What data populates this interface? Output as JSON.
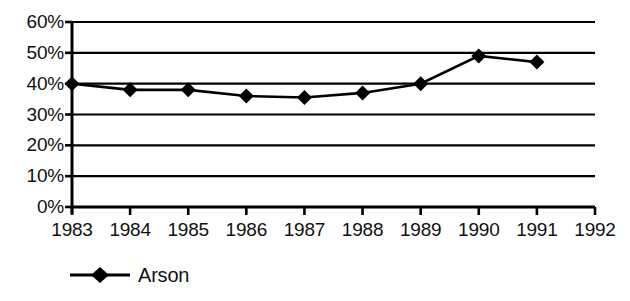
{
  "chart_data": {
    "type": "line",
    "title": "",
    "subtitle": "",
    "xlabel": "",
    "ylabel": "",
    "categories": [
      "1983",
      "1984",
      "1985",
      "1986",
      "1987",
      "1988",
      "1989",
      "1990",
      "1991",
      "1992"
    ],
    "x_tick_labels": [
      "1983",
      "1984",
      "1985",
      "1986",
      "1987",
      "1988",
      "1989",
      "1990",
      "1991",
      "1992"
    ],
    "y_tick_labels": [
      "60%",
      "50%",
      "40%",
      "30%",
      "20%",
      "10%",
      "0%"
    ],
    "y_tick_values": [
      60,
      50,
      40,
      30,
      20,
      10,
      0
    ],
    "ylim": [
      0,
      60
    ],
    "xlim": [
      "1983",
      "1992"
    ],
    "grid": "horizontal",
    "legend_position": "bottom-left",
    "series": [
      {
        "name": "Arson",
        "color": "#000000",
        "marker": "diamond",
        "x": [
          "1983",
          "1984",
          "1985",
          "1986",
          "1987",
          "1988",
          "1989",
          "1990",
          "1991"
        ],
        "values": [
          40,
          38,
          38,
          36,
          35.5,
          37,
          40,
          49,
          47
        ]
      }
    ],
    "annotations": []
  },
  "legend": {
    "entries": [
      {
        "label": "Arson"
      }
    ]
  },
  "icons": {
    "legend_marker": "diamond-marker-icon"
  }
}
